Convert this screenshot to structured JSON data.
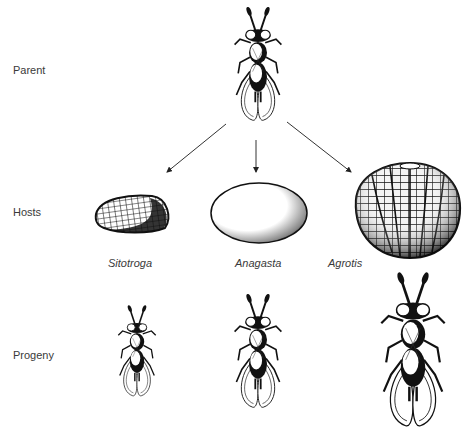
{
  "figure": {
    "rows": {
      "parent": "Parent",
      "hosts": "Hosts",
      "progeny": "Progeny"
    },
    "hosts": [
      {
        "name": "Sitotroga",
        "egg": "small-ridged-oval-egg"
      },
      {
        "name": "Anagasta",
        "egg": "medium-smooth-oval-egg"
      },
      {
        "name": "Agrotis",
        "egg": "large-ribbed-round-egg"
      }
    ],
    "progeny_sizes": [
      "small",
      "medium",
      "large"
    ],
    "colors": {
      "ink": "#1a1a1a",
      "label": "#3a3a3a",
      "background": "#ffffff"
    }
  }
}
